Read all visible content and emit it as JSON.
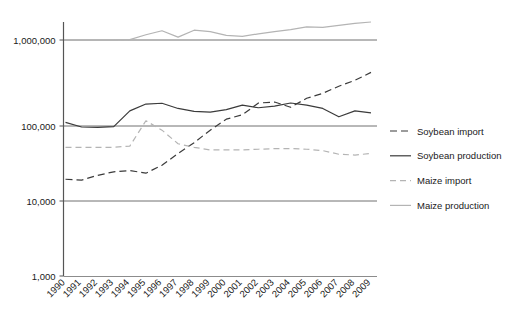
{
  "chart_data": {
    "type": "line",
    "title": "",
    "subtitle": "",
    "xlabel": "",
    "ylabel": "",
    "yscale": "log",
    "ylim": [
      1000,
      3000000
    ],
    "grid": true,
    "gridlines": [
      1000,
      10000,
      100000,
      1000000
    ],
    "ytick_labels": [
      "1,000,000",
      "100,000",
      "10,000",
      "1,000"
    ],
    "ytick_values": [
      1000000,
      100000,
      10000,
      1000
    ],
    "legend_position": "right",
    "categories": [
      "1990",
      "1991",
      "1992",
      "1993",
      "1994",
      "1995",
      "1996",
      "1997",
      "1998",
      "1999",
      "2000",
      "2001",
      "2002",
      "2003",
      "2004",
      "2005",
      "2006",
      "2007",
      "2008",
      "2009"
    ],
    "x": [
      1990,
      1991,
      1992,
      1993,
      1994,
      1995,
      1996,
      1997,
      1998,
      1999,
      2000,
      2001,
      2002,
      2003,
      2004,
      2005,
      2006,
      2007,
      2008,
      2009
    ],
    "series": [
      {
        "name": "Soybean import",
        "key": "soybean_import",
        "style": "dashed",
        "color": "#3b3b3b",
        "dash": "7,4",
        "width": 1.2,
        "values": [
          19500,
          19000,
          22000,
          24500,
          25500,
          23500,
          30000,
          43000,
          60000,
          88000,
          120000,
          135000,
          185000,
          190000,
          165000,
          210000,
          240000,
          290000,
          340000,
          420000
        ]
      },
      {
        "name": "Soybean production",
        "key": "soybean_production",
        "style": "solid",
        "color": "#3b3b3b",
        "dash": "",
        "width": 1.2,
        "values": [
          110000,
          97000,
          96000,
          98000,
          150000,
          180000,
          184000,
          160000,
          148000,
          145000,
          155000,
          175000,
          163000,
          170000,
          185000,
          175000,
          160000,
          128000,
          150000,
          142000
        ]
      },
      {
        "name": "Maize import",
        "key": "maize_import",
        "style": "dashed",
        "color": "#b4b4b4",
        "dash": "6,4",
        "width": 1.2,
        "values": [
          52000,
          52000,
          52000,
          52000,
          54000,
          115000,
          88000,
          58000,
          52000,
          48000,
          48000,
          48000,
          49000,
          50000,
          50000,
          49000,
          47000,
          42000,
          41000,
          43000
        ]
      },
      {
        "name": "Maize production",
        "key": "maize_production",
        "style": "solid",
        "color": "#b4b4b4",
        "dash": "",
        "width": 1.2,
        "values": [
          1000000,
          1000000,
          1000000,
          1000000,
          1010000,
          1150000,
          1280000,
          1080000,
          1300000,
          1250000,
          1130000,
          1100000,
          1180000,
          1250000,
          1320000,
          1420000,
          1400000,
          1480000,
          1560000,
          1620000
        ]
      }
    ]
  },
  "legend": {
    "items": [
      {
        "label": "Soybean import"
      },
      {
        "label": "Soybean production"
      },
      {
        "label": "Maize import"
      },
      {
        "label": "Maize production"
      }
    ]
  },
  "axes": {
    "y_ticks": [
      "1,000,000",
      "100,000",
      "10,000",
      "1,000"
    ],
    "x_ticks": [
      "1990",
      "1991",
      "1992",
      "1993",
      "1994",
      "1995",
      "1996",
      "1997",
      "1998",
      "1999",
      "2000",
      "2001",
      "2002",
      "2003",
      "2004",
      "2005",
      "2006",
      "2007",
      "2008",
      "2009"
    ]
  },
  "colors": {
    "soybean": "#3b3b3b",
    "maize": "#b4b4b4",
    "axis": "#555555",
    "grid": "#707070",
    "text": "#1a1a1a"
  }
}
